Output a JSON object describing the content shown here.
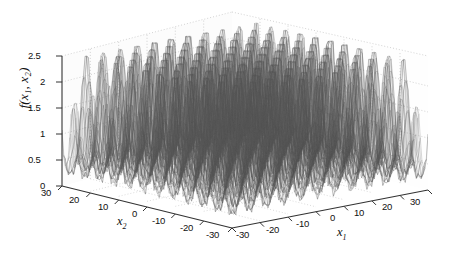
{
  "figure": {
    "type": "3d-surface-mesh",
    "background": "#ffffff",
    "mesh_color": "#4a4a4a",
    "axis_color": "#3a3a3a",
    "grid_color": "#b9b9b9"
  },
  "axes": {
    "z": {
      "label": "f(x₁, x₂)",
      "label_base": "f(",
      "label_v1": "1",
      "label_v2": "2",
      "ticks": [
        "2.5",
        "2",
        "1.5",
        "1",
        "0.5",
        "0"
      ],
      "min": 0,
      "max": 2.5
    },
    "x2": {
      "label": "x",
      "sub": "2",
      "ticks": [
        "30",
        "20",
        "10",
        "0",
        "-10",
        "-20",
        "-30"
      ],
      "min": -30,
      "max": 30
    },
    "x1": {
      "label": "x",
      "sub": "1",
      "ticks": [
        "-30",
        "-20",
        "-10",
        "0",
        "10",
        "20",
        "30"
      ],
      "min": -30,
      "max": 30
    }
  },
  "chart_data": {
    "type": "surface",
    "title": "",
    "xlabel": "x₂",
    "ylabel": "x₁",
    "zlabel": "f(x₁, x₂)",
    "xlim": [
      -30,
      30
    ],
    "ylim": [
      -30,
      30
    ],
    "zlim": [
      0,
      2.5
    ],
    "grid": true,
    "legend": null,
    "projection": "3d",
    "colormap": "grayscale-mesh",
    "x_ticks": [
      -30,
      -20,
      -10,
      0,
      10,
      20,
      30
    ],
    "y_ticks": [
      -30,
      -20,
      -10,
      0,
      10,
      20,
      30
    ],
    "z_ticks": [
      0,
      0.5,
      1,
      1.5,
      2,
      2.5
    ],
    "peak_envelope_profile": {
      "x": [
        -30,
        -25,
        -20,
        -15,
        -10,
        -5,
        0,
        5,
        10,
        15,
        20,
        25,
        30
      ],
      "values": [
        1.75,
        1.85,
        1.95,
        2.05,
        2.2,
        2.4,
        2.5,
        2.4,
        2.2,
        2.05,
        1.95,
        1.85,
        1.75
      ]
    },
    "ridge_count_x1": 23,
    "ridge_count_x2": 23,
    "base_level": 1.0
  }
}
